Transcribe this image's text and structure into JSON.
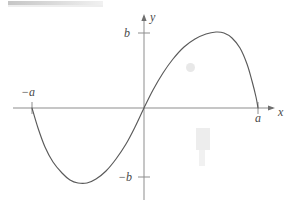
{
  "figure": {
    "kind": "cartesian-plot",
    "width": 293,
    "height": 209,
    "background_color": "#ffffff",
    "stroke_color": "#5a5a5a",
    "axis_color": "#8a8a8a",
    "label_color": "#4a4a4a"
  },
  "axes": {
    "x_label": "x",
    "y_label": "y",
    "origin": {
      "x": 144,
      "y": 108
    },
    "x_axis": {
      "start_px": 13,
      "end_px": 275,
      "y_px": 108,
      "arrow": "right"
    },
    "y_axis": {
      "top_px": 14,
      "bottom_px": 200,
      "x_px": 144,
      "arrow": "up"
    }
  },
  "ticks": [
    {
      "name": "b",
      "label": "b",
      "axis": "y",
      "y_px": 33,
      "label_x": 124,
      "label_y": 27
    },
    {
      "name": "-b",
      "label": "−b",
      "axis": "y",
      "y_px": 177,
      "label_x": 118,
      "label_y": 171
    },
    {
      "name": "-a",
      "label": "−a",
      "axis": "x",
      "x_px": 32,
      "label_x": 21,
      "label_y": 86
    },
    {
      "name": "a",
      "label": "a",
      "axis": "x",
      "x_px": 258,
      "label_x": 255,
      "label_y": 112
    }
  ],
  "chart_data": {
    "type": "line",
    "title": "",
    "xlabel": "x",
    "ylabel": "y",
    "grid": false,
    "legend": null,
    "xlim": [
      "-a",
      "a"
    ],
    "ylim": [
      "-b",
      "b"
    ],
    "tick_labels": {
      "x": [
        "−a",
        "a"
      ],
      "y": [
        "b",
        "−b"
      ]
    },
    "series": [
      {
        "name": "cubic-curve",
        "roots": [
          "-a",
          "0",
          "a"
        ],
        "local_minimum": {
          "x": "between -a and 0",
          "y": "−b"
        },
        "local_maximum": {
          "x": "between 0 and a",
          "y": "b"
        },
        "points_px": [
          [
            32,
            108
          ],
          [
            38,
            128
          ],
          [
            45,
            147
          ],
          [
            53,
            162
          ],
          [
            62,
            173
          ],
          [
            70,
            180
          ],
          [
            78,
            183
          ],
          [
            87,
            183
          ],
          [
            96,
            179
          ],
          [
            106,
            171
          ],
          [
            116,
            159
          ],
          [
            126,
            144
          ],
          [
            135,
            127
          ],
          [
            144,
            108
          ],
          [
            153,
            90
          ],
          [
            163,
            73
          ],
          [
            173,
            59
          ],
          [
            184,
            47
          ],
          [
            195,
            39
          ],
          [
            206,
            34
          ],
          [
            216,
            32
          ],
          [
            224,
            33
          ],
          [
            232,
            38
          ],
          [
            240,
            48
          ],
          [
            247,
            64
          ],
          [
            252,
            81
          ],
          [
            256,
            97
          ],
          [
            258,
            108
          ]
        ]
      }
    ]
  },
  "artifacts": [
    {
      "name": "scan-bar",
      "kind": "gray-bar",
      "x": 8,
      "y": 1,
      "width": 95,
      "height": 6
    },
    {
      "name": "smudge-upper-right",
      "kind": "faint-smudge",
      "x": 186,
      "y": 63
    },
    {
      "name": "smudge-lower-right",
      "kind": "faint-smudge",
      "x": 196,
      "y": 128
    }
  ]
}
